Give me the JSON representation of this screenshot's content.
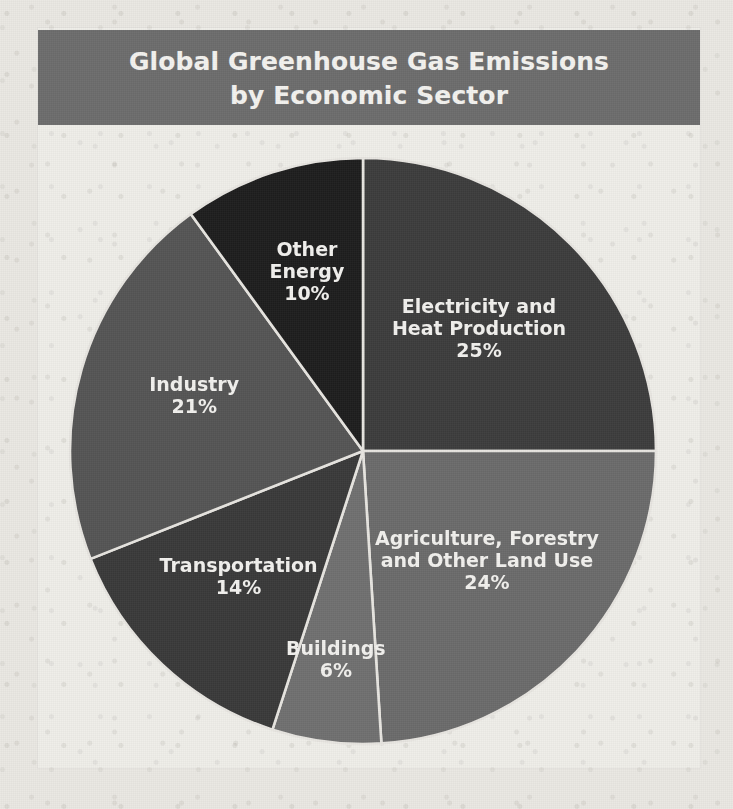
{
  "title": {
    "line1": "Global Greenhouse Gas Emissions",
    "line2": "by Economic Sector"
  },
  "colors": {
    "banner": "#6d6d6d",
    "page_background": "#ebe9e4",
    "panel_background": "#f0efea",
    "label_text": "#f2f1ee",
    "separator": "#e8e6e1"
  },
  "chart_data": {
    "type": "pie",
    "title": "Global Greenhouse Gas Emissions by Economic Sector",
    "xlabel": "",
    "ylabel": "",
    "units": "percent",
    "start_angle_deg": 0,
    "direction": "clockwise",
    "legend": "none",
    "grid": false,
    "categories": [
      "Electricity and Heat Production",
      "Agriculture, Forestry and Other Land Use",
      "Buildings",
      "Transportation",
      "Industry",
      "Other Energy"
    ],
    "values": [
      25,
      24,
      6,
      14,
      21,
      10
    ],
    "slices": [
      {
        "label_line1": "Electricity and",
        "label_line2": "Heat Production",
        "value_label": "25%",
        "value": 25,
        "color": "#3d3d3d"
      },
      {
        "label_line1": "Agriculture, Forestry",
        "label_line2": "and Other Land Use",
        "value_label": "24%",
        "value": 24,
        "color": "#6b6b6b"
      },
      {
        "label_line1": "Buildings",
        "label_line2": "",
        "value_label": "6%",
        "value": 6,
        "color": "#707070"
      },
      {
        "label_line1": "Transportation",
        "label_line2": "",
        "value_label": "14%",
        "value": 14,
        "color": "#3a3a3a"
      },
      {
        "label_line1": "Industry",
        "label_line2": "",
        "value_label": "21%",
        "value": 21,
        "color": "#555555"
      },
      {
        "label_line1": "Other",
        "label_line2": "Energy",
        "value_label": "10%",
        "value": 10,
        "color": "#1e1e1e"
      }
    ]
  }
}
